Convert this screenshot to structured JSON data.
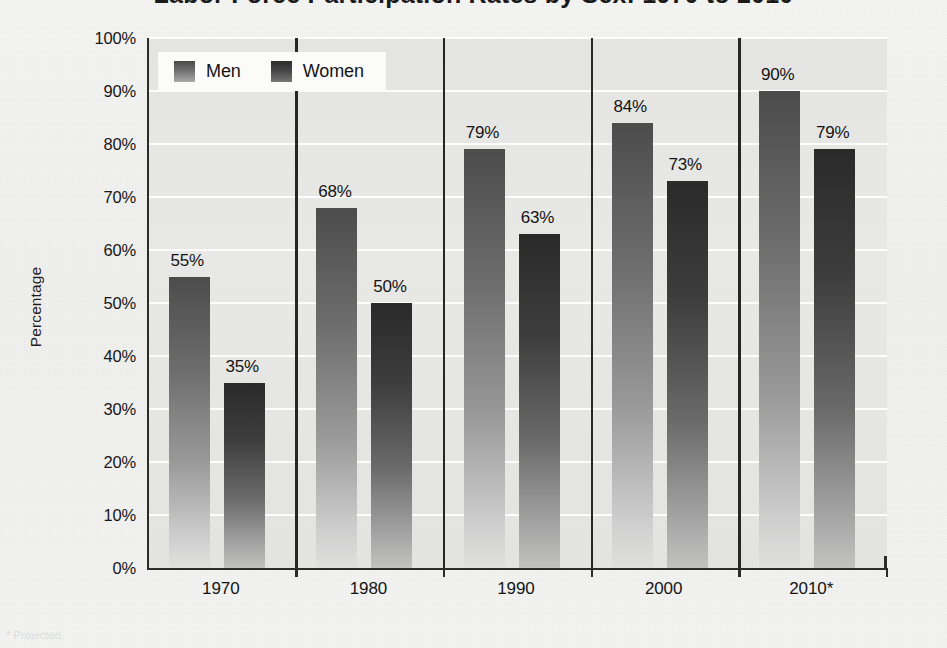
{
  "figure": {
    "title": "Labor Force Participation Rates by Sex: 1970 to 2010",
    "footnote": "* Projected.",
    "ylabel": "Percentage"
  },
  "legend": {
    "position": "top-left",
    "items": [
      {
        "label": "Men",
        "swatch": "men-swatch"
      },
      {
        "label": "Women",
        "swatch": "women-swatch"
      }
    ]
  },
  "yticks": [
    "100%",
    "90%",
    "80%",
    "70%",
    "60%",
    "50%",
    "40%",
    "30%",
    "20%",
    "10%",
    "0%"
  ],
  "xticks": [
    "1970",
    "1980",
    "1990",
    "2000",
    "2010*"
  ],
  "chart_data": {
    "type": "bar",
    "title": "Labor Force Participation Rates by Sex: 1970 to 2010",
    "xlabel": "",
    "ylabel": "Percentage",
    "ylim": [
      0,
      100
    ],
    "yticks": [
      0,
      10,
      20,
      30,
      40,
      50,
      60,
      70,
      80,
      90,
      100
    ],
    "grid": true,
    "grid_color": "#fdfdfd",
    "legend_position": "top-left",
    "categories": [
      "1970",
      "1980",
      "1990",
      "2000",
      "2010*"
    ],
    "series": [
      {
        "name": "Men",
        "color": "#6d6d6d",
        "values": [
          55,
          68,
          79,
          84,
          90
        ],
        "labels": [
          "55%",
          "68%",
          "79%",
          "84%",
          "90%"
        ]
      },
      {
        "name": "Women",
        "color": "#3d3d3d",
        "values": [
          35,
          50,
          63,
          73,
          79
        ],
        "labels": [
          "35%",
          "50%",
          "63%",
          "73%",
          "79%"
        ]
      }
    ],
    "annotations": [
      "* Projected."
    ]
  }
}
